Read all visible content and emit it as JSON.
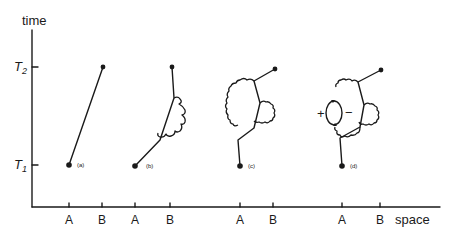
{
  "axes": {
    "y_label": "time",
    "x_label": "space",
    "y_ticks": [
      {
        "label": "T",
        "sub": "2"
      },
      {
        "label": "T",
        "sub": "1"
      }
    ],
    "x_ticks": [
      "A",
      "B",
      "A",
      "B",
      "A",
      "B",
      "A",
      "B"
    ]
  },
  "panels": [
    {
      "id": "a",
      "label": "(a)",
      "description": "single straight worldline from A at T1 to B at T2"
    },
    {
      "id": "b",
      "label": "(b)",
      "description": "worldline with one wavy photon loop (self-energy)"
    },
    {
      "id": "c",
      "label": "(c)",
      "description": "worldline with two wavy photon loops"
    },
    {
      "id": "d",
      "label": "(d)",
      "description": "worldline with photon loops and vacuum polarization bubble"
    }
  ],
  "annotations": {
    "plus": "+",
    "minus": "−"
  }
}
